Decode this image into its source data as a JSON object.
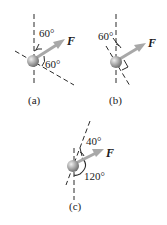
{
  "figures": [
    {
      "id": "a",
      "caption": "(a)",
      "force_label": "F",
      "angles": [
        {
          "label": "60°",
          "between": "vertical axis and F"
        },
        {
          "label": "60°",
          "between": "F and inclined axis"
        }
      ]
    },
    {
      "id": "b",
      "caption": "(b)",
      "force_label": "F",
      "angles": [
        {
          "label": "60°",
          "between": "vertical axis and inclined axis"
        }
      ],
      "right_angle_marker": true
    },
    {
      "id": "c",
      "caption": "(c)",
      "force_label": "F",
      "angles": [
        {
          "label": "40°",
          "between": "inclined axis and F"
        },
        {
          "label": "120°",
          "between": "F and vertical axis (below)"
        }
      ]
    }
  ],
  "colors": {
    "line": "#2a2a2a",
    "arrow": "#a8a8a8",
    "sphere_light": "#e6e6e6",
    "sphere_dark": "#7a7a7a"
  }
}
